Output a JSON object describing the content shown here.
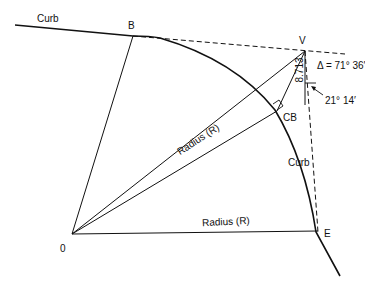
{
  "diagram": {
    "points": {
      "B": "B",
      "V": "V",
      "CB": "CB",
      "E": "E",
      "O": "0"
    },
    "labels": {
      "curb_top": "Curb",
      "curb_arc": "Curb",
      "radius_1": "Radius (R)",
      "radius_2": "Radius (R)",
      "distance": "8.713",
      "delta": "Δ = 71° 36′",
      "angle": "21° 14′"
    }
  }
}
